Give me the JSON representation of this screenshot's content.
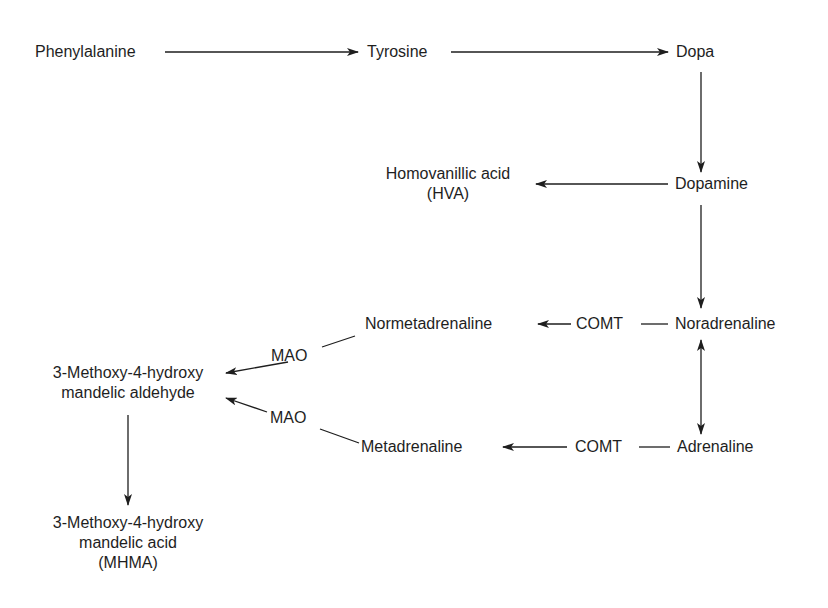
{
  "diagram": {
    "type": "metabolic-pathway",
    "nodes": {
      "phenylalanine": "Phenylalanine",
      "tyrosine": "Tyrosine",
      "dopa": "Dopa",
      "dopamine": "Dopamine",
      "hva": [
        "Homovanillic acid",
        "(HVA)"
      ],
      "noradrenaline": "Noradrenaline",
      "adrenaline": "Adrenaline",
      "normetadrenaline": "Normetadrenaline",
      "metadrenaline": "Metadrenaline",
      "aldehyde": [
        "3-Methoxy-4-hydroxy",
        "mandelic aldehyde"
      ],
      "mhma": [
        "3-Methoxy-4-hydroxy",
        "mandelic acid",
        "(MHMA)"
      ]
    },
    "enzymes": {
      "comt_top": "COMT",
      "comt_bottom": "COMT",
      "mao_top": "MAO",
      "mao_bottom": "MAO"
    },
    "edges": [
      {
        "from": "Phenylalanine",
        "to": "Tyrosine"
      },
      {
        "from": "Tyrosine",
        "to": "Dopa"
      },
      {
        "from": "Dopa",
        "to": "Dopamine"
      },
      {
        "from": "Dopamine",
        "to": "Homovanillic acid (HVA)"
      },
      {
        "from": "Dopamine",
        "to": "Noradrenaline"
      },
      {
        "from": "Noradrenaline",
        "to": "Normetadrenaline",
        "via": "COMT"
      },
      {
        "from": "Noradrenaline",
        "to": "Adrenaline",
        "bidirectional": true
      },
      {
        "from": "Adrenaline",
        "to": "Metadrenaline",
        "via": "COMT"
      },
      {
        "from": "Normetadrenaline",
        "to": "3-Methoxy-4-hydroxy mandelic aldehyde",
        "via": "MAO"
      },
      {
        "from": "Metadrenaline",
        "to": "3-Methoxy-4-hydroxy mandelic aldehyde",
        "via": "MAO"
      },
      {
        "from": "3-Methoxy-4-hydroxy mandelic aldehyde",
        "to": "3-Methoxy-4-hydroxy mandelic acid (MHMA)"
      }
    ],
    "line_color": "#1e1e1e"
  }
}
